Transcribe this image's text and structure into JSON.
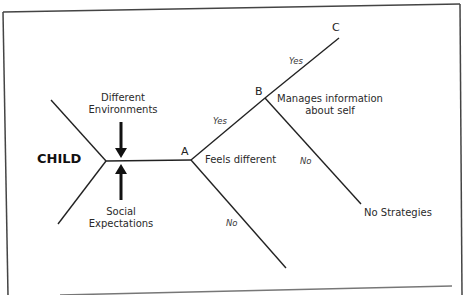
{
  "diagram": {
    "root": "CHILD",
    "influences": {
      "top": [
        "Different",
        "Environments"
      ],
      "bottom": [
        "Social",
        "Expectations"
      ]
    },
    "nodes": {
      "a": {
        "label": "A",
        "description": "Feels different"
      },
      "b": {
        "label": "B",
        "description": [
          "Manages information",
          "about self"
        ]
      },
      "c": {
        "label": "C"
      }
    },
    "branches": {
      "a_yes": "Yes",
      "a_no": "No",
      "b_yes": "Yes",
      "b_no": "No"
    },
    "outcomes": {
      "b_no": "No Strategies"
    }
  }
}
